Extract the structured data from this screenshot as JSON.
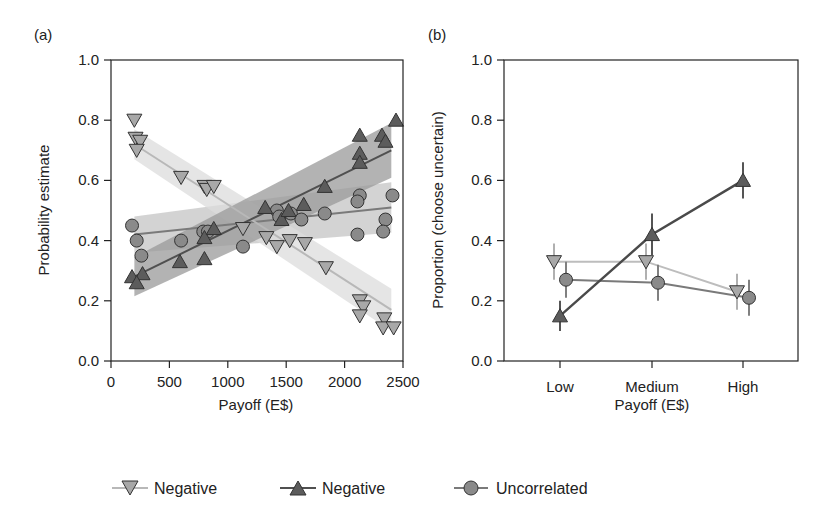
{
  "colors": {
    "neg_down": "#a8a8a8",
    "neg_down_line": "#b8b8b8",
    "neg_down_band": "#dcdcdc",
    "neg_up": "#5c5c5c",
    "neg_up_line": "#505050",
    "neg_up_band": "#9a9a9a",
    "uncorr": "#8a8a8a",
    "uncorr_line": "#7a7a7a",
    "uncorr_band": "#c4c4c4",
    "stroke": "#333333",
    "axis": "#222222"
  },
  "legend": [
    {
      "marker": "triangle-down",
      "label": "Negative",
      "color_key": "neg_down"
    },
    {
      "marker": "triangle-up",
      "label": "Negative",
      "color_key": "neg_up"
    },
    {
      "marker": "circle",
      "label": "Uncorrelated",
      "color_key": "uncorr"
    }
  ],
  "chart_data": [
    {
      "panel_label": "(a)",
      "type": "scatter",
      "xlabel": "Payoff (E$)",
      "ylabel": "Probability estimate",
      "xlim": [
        0,
        2500
      ],
      "ylim": [
        0.0,
        1.0
      ],
      "xticks": [
        "0",
        "500",
        "1000",
        "1500",
        "2000",
        "2500"
      ],
      "yticks": [
        "0.0",
        "0.2",
        "0.4",
        "0.6",
        "0.8",
        "1.0"
      ],
      "grid": false,
      "series": [
        {
          "name": "Negative (decreasing)",
          "marker": "triangle-down",
          "fit": {
            "x": [
              200,
              2400
            ],
            "y": [
              0.72,
              0.17
            ],
            "band": 0.05
          },
          "points": [
            [
              200,
              0.8
            ],
            [
              210,
              0.74
            ],
            [
              250,
              0.73
            ],
            [
              220,
              0.7
            ],
            [
              600,
              0.61
            ],
            [
              800,
              0.58
            ],
            [
              820,
              0.57
            ],
            [
              880,
              0.58
            ],
            [
              1130,
              0.44
            ],
            [
              1330,
              0.41
            ],
            [
              1420,
              0.38
            ],
            [
              1530,
              0.4
            ],
            [
              1660,
              0.39
            ],
            [
              1840,
              0.31
            ],
            [
              2130,
              0.2
            ],
            [
              2160,
              0.18
            ],
            [
              2130,
              0.15
            ],
            [
              2340,
              0.14
            ],
            [
              2330,
              0.11
            ],
            [
              2420,
              0.11
            ]
          ]
        },
        {
          "name": "Negative (increasing)",
          "marker": "triangle-up",
          "fit": {
            "x": [
              200,
              2400
            ],
            "y": [
              0.28,
              0.7
            ],
            "band": 0.065
          },
          "points": [
            [
              180,
              0.28
            ],
            [
              270,
              0.29
            ],
            [
              220,
              0.26
            ],
            [
              590,
              0.33
            ],
            [
              800,
              0.34
            ],
            [
              800,
              0.41
            ],
            [
              880,
              0.44
            ],
            [
              1320,
              0.51
            ],
            [
              1460,
              0.47
            ],
            [
              1520,
              0.5
            ],
            [
              1650,
              0.52
            ],
            [
              1830,
              0.58
            ],
            [
              2130,
              0.75
            ],
            [
              2130,
              0.69
            ],
            [
              2130,
              0.66
            ],
            [
              2320,
              0.75
            ],
            [
              2350,
              0.73
            ],
            [
              2440,
              0.8
            ]
          ]
        },
        {
          "name": "Uncorrelated",
          "marker": "circle",
          "fit": {
            "x": [
              200,
              2400
            ],
            "y": [
              0.42,
              0.51
            ],
            "band": 0.06
          },
          "points": [
            [
              180,
              0.45
            ],
            [
              220,
              0.4
            ],
            [
              260,
              0.35
            ],
            [
              600,
              0.4
            ],
            [
              790,
              0.43
            ],
            [
              830,
              0.43
            ],
            [
              1130,
              0.38
            ],
            [
              1420,
              0.5
            ],
            [
              1440,
              0.48
            ],
            [
              1540,
              0.49
            ],
            [
              1630,
              0.47
            ],
            [
              1830,
              0.49
            ],
            [
              2130,
              0.55
            ],
            [
              2110,
              0.53
            ],
            [
              2410,
              0.55
            ],
            [
              2350,
              0.47
            ],
            [
              2110,
              0.42
            ],
            [
              2330,
              0.43
            ]
          ]
        }
      ]
    },
    {
      "panel_label": "(b)",
      "type": "line",
      "xlabel": "Payoff (E$)",
      "ylabel": "Proportion (choose uncertain)",
      "categories": [
        "Low",
        "Medium",
        "High"
      ],
      "ylim": [
        0.0,
        1.0
      ],
      "yticks": [
        "0.0",
        "0.2",
        "0.4",
        "0.6",
        "0.8",
        "1.0"
      ],
      "grid": false,
      "series": [
        {
          "name": "Negative (decreasing)",
          "marker": "triangle-down",
          "values": [
            0.33,
            0.33,
            0.23
          ],
          "err": [
            0.06,
            0.06,
            0.06
          ]
        },
        {
          "name": "Negative (increasing)",
          "marker": "triangle-up",
          "values": [
            0.15,
            0.42,
            0.6
          ],
          "err": [
            0.05,
            0.07,
            0.06
          ]
        },
        {
          "name": "Uncorrelated",
          "marker": "circle",
          "values": [
            0.27,
            0.26,
            0.21
          ],
          "err": [
            0.06,
            0.06,
            0.06
          ]
        }
      ]
    }
  ]
}
